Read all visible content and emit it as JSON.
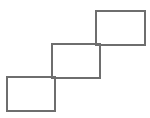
{
  "figure": {
    "canvas": {
      "width": 150,
      "height": 118,
      "background_color": "#ffffff"
    },
    "style": {
      "stroke_color": "#6e6e6e",
      "stroke_width": 1.6,
      "fill": "none"
    },
    "shapes": [
      {
        "name": "top-right-square",
        "type": "rectangle",
        "x": 96,
        "y": 11,
        "width": 49,
        "height": 34,
        "label": "Top right square"
      },
      {
        "name": "middle-square",
        "type": "rectangle",
        "x": 52,
        "y": 44,
        "width": 48,
        "height": 34,
        "label": "Middle square"
      },
      {
        "name": "bottom-left-square",
        "type": "rectangle",
        "x": 7,
        "y": 77,
        "width": 48,
        "height": 34,
        "label": "Bottom left square"
      }
    ]
  }
}
